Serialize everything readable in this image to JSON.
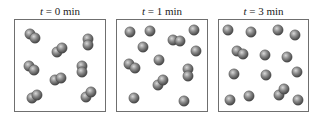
{
  "figure": {
    "atom_radius": 5.2,
    "colors": {
      "atom_highlight": "#d8d8d8",
      "atom_mid": "#8a8a8a",
      "atom_shadow": "#3c3c3c",
      "box_border": "#6f6f6f",
      "title_text": "#222222"
    },
    "panels": [
      {
        "title_var": "t",
        "title_rest": " = 0 min",
        "box": {
          "left": 14,
          "width": 92
        },
        "molecules": [
          {
            "type": "diatomic",
            "atoms": [
              [
                30,
                34
              ],
              [
                35,
                38
              ]
            ]
          },
          {
            "type": "diatomic",
            "atoms": [
              [
                57,
                52
              ],
              [
                62,
                48
              ]
            ]
          },
          {
            "type": "diatomic",
            "atoms": [
              [
                88,
                39
              ],
              [
                88,
                45
              ]
            ]
          },
          {
            "type": "diatomic",
            "atoms": [
              [
                29,
                66
              ],
              [
                34,
                70
              ]
            ]
          },
          {
            "type": "diatomic",
            "atoms": [
              [
                55,
                80
              ],
              [
                61,
                78
              ]
            ]
          },
          {
            "type": "diatomic",
            "atoms": [
              [
                82,
                66
              ],
              [
                82,
                72
              ]
            ]
          },
          {
            "type": "diatomic",
            "atoms": [
              [
                32,
                98
              ],
              [
                37,
                95
              ]
            ]
          },
          {
            "type": "diatomic",
            "atoms": [
              [
                86,
                97
              ],
              [
                91,
                92
              ]
            ]
          }
        ]
      },
      {
        "title_var": "t",
        "title_rest": " = 1 min",
        "box": {
          "left": 116,
          "width": 92
        },
        "molecules": [
          {
            "type": "atom",
            "atoms": [
              [
                130,
                32
              ]
            ]
          },
          {
            "type": "atom",
            "atoms": [
              [
                150,
                31
              ]
            ]
          },
          {
            "type": "diatomic",
            "atoms": [
              [
                173,
                40
              ],
              [
                180,
                41
              ]
            ]
          },
          {
            "type": "atom",
            "atoms": [
              [
                194,
                30
              ]
            ]
          },
          {
            "type": "atom",
            "atoms": [
              [
                143,
                47
              ]
            ]
          },
          {
            "type": "atom",
            "atoms": [
              [
                196,
                51
              ]
            ]
          },
          {
            "type": "diatomic",
            "atoms": [
              [
                129,
                64
              ],
              [
                135,
                68
              ]
            ]
          },
          {
            "type": "atom",
            "atoms": [
              [
                159,
                60
              ]
            ]
          },
          {
            "type": "diatomic",
            "atoms": [
              [
                188,
                69
              ],
              [
                188,
                76
              ]
            ]
          },
          {
            "type": "diatomic",
            "atoms": [
              [
                158,
                85
              ],
              [
                163,
                80
              ]
            ]
          },
          {
            "type": "atom",
            "atoms": [
              [
                134,
                98
              ]
            ]
          },
          {
            "type": "atom",
            "atoms": [
              [
                184,
                101
              ]
            ]
          }
        ]
      },
      {
        "title_var": "t",
        "title_rest": " = 3 min",
        "box": {
          "left": 218,
          "width": 91
        },
        "molecules": [
          {
            "type": "atom",
            "atoms": [
              [
                228,
                30
              ]
            ]
          },
          {
            "type": "atom",
            "atoms": [
              [
                251,
                32
              ]
            ]
          },
          {
            "type": "atom",
            "atoms": [
              [
                278,
                30
              ]
            ]
          },
          {
            "type": "atom",
            "atoms": [
              [
                295,
                35
              ]
            ]
          },
          {
            "type": "diatomic",
            "atoms": [
              [
                237,
                51
              ],
              [
                243,
                54
              ]
            ]
          },
          {
            "type": "atom",
            "atoms": [
              [
                265,
                55
              ]
            ]
          },
          {
            "type": "atom",
            "atoms": [
              [
                287,
                57
              ]
            ]
          },
          {
            "type": "atom",
            "atoms": [
              [
                234,
                74
              ]
            ]
          },
          {
            "type": "atom",
            "atoms": [
              [
                266,
                75
              ]
            ]
          },
          {
            "type": "atom",
            "atoms": [
              [
                297,
                72
              ]
            ]
          },
          {
            "type": "diatomic",
            "atoms": [
              [
                279,
                95
              ],
              [
                284,
                89
              ]
            ]
          },
          {
            "type": "atom",
            "atoms": [
              [
                230,
                100
              ]
            ]
          },
          {
            "type": "atom",
            "atoms": [
              [
                249,
                96
              ]
            ]
          },
          {
            "type": "atom",
            "atoms": [
              [
                298,
                100
              ]
            ]
          }
        ]
      }
    ]
  }
}
